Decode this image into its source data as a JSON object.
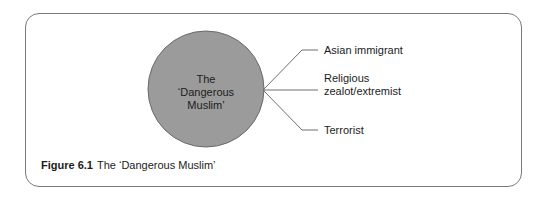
{
  "figure": {
    "number_label": "Figure 6.1",
    "caption_text": "The ‘Dangerous Muslim’"
  },
  "center_node": {
    "lines": [
      "The",
      "‘Dangerous",
      "Muslim’"
    ],
    "fill_color": "#9b9b9b"
  },
  "branches": [
    {
      "lines": [
        "Asian immigrant"
      ]
    },
    {
      "lines": [
        "Religious",
        "zealot/extremist"
      ]
    },
    {
      "lines": [
        "Terrorist"
      ]
    }
  ],
  "colors": {
    "line": "#6e6e6e",
    "frame": "#7a7a7a",
    "text": "#1c1c1c"
  }
}
